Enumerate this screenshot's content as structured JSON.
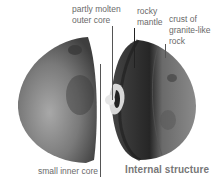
{
  "labels": {
    "outer_core_line1": "partly molten",
    "outer_core_line2": "outer core",
    "mantle_line1": "rocky",
    "mantle_line2": "mantle",
    "crust_line1": "crust of",
    "crust_line2": "granite-like",
    "crust_line3": "rock",
    "inner_core": "small inner core"
  },
  "title": "Internal structure",
  "colors": {
    "label_text": "#6a6a6a",
    "title_text": "#777777",
    "leader_line": "#555555",
    "surface_dark": "#3a3a3a",
    "surface_light": "#9a9a9a",
    "core": "#d8d8d8"
  }
}
